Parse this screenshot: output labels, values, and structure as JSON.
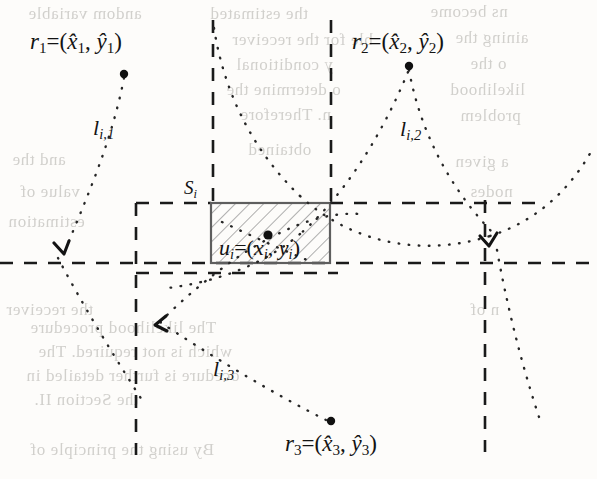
{
  "figure": {
    "background_color": "#fdfcfa",
    "ink_color": "#131313"
  },
  "labels": {
    "r1": {
      "text": "r₁=(x̂1, ŷ1)",
      "base": "r",
      "sub": "1",
      "x1": "x",
      "y1": "y",
      "pos": {
        "x": 30,
        "y": 30
      }
    },
    "r2": {
      "text": "r₂=(x̂2, ŷ2)",
      "base": "r",
      "sub": "2",
      "pos": {
        "x": 352,
        "y": 30
      }
    },
    "r3": {
      "text": "r₃=(x̂3, ŷ3)",
      "base": "r",
      "sub": "3",
      "pos": {
        "x": 285,
        "y": 432
      }
    },
    "l1": {
      "text": "lᵢ,₁",
      "base": "l",
      "sub": "i,1",
      "pos": {
        "x": 93,
        "y": 117
      }
    },
    "l2": {
      "text": "lᵢ,₂",
      "base": "l",
      "sub": "i,2",
      "pos": {
        "x": 400,
        "y": 118
      }
    },
    "l3": {
      "text": "lᵢ,₃",
      "base": "l",
      "sub": "i,3",
      "pos": {
        "x": 213,
        "y": 358
      }
    },
    "si": {
      "text": "Sᵢ",
      "base": "S",
      "sub": "i",
      "pos": {
        "x": 184,
        "y": 178
      }
    },
    "ui": {
      "text": "uᵢ=(xᵢ, yᵢ)",
      "base": "u",
      "sub": "i",
      "pos": {
        "x": 219,
        "y": 237
      }
    }
  },
  "anchors": {
    "r1_point": {
      "x": 124,
      "y": 72
    },
    "r2_point": {
      "x": 409,
      "y": 64
    },
    "r3_point": {
      "x": 331,
      "y": 423
    },
    "ui_point": {
      "x": 268,
      "y": 238
    }
  },
  "region": {
    "name": "S_i",
    "hatched_rect": {
      "x": 211,
      "y": 203,
      "width": 119,
      "height": 60
    },
    "hatch_angle_deg": 45,
    "hatch_color": "#8d8d8d",
    "border_color": "#5e5e5e"
  },
  "grid": {
    "style": "dashed",
    "color": "#1a1a1a",
    "vertical_lines_x": [
      136,
      211,
      330,
      485
    ],
    "horizontal_lines_y": [
      203,
      263,
      273
    ]
  },
  "dotted_paths": {
    "color": "#262626",
    "style": "dotted",
    "description": "Distance measurement arcs from each reference node r_k toward the region S_i"
  },
  "arrowheads": [
    {
      "name": "arrowhead-l1",
      "x": 62,
      "y": 252,
      "angle_deg": 205
    },
    {
      "name": "arrowhead-l2",
      "x": 488,
      "y": 243,
      "angle_deg": 250
    },
    {
      "name": "arrowhead-l3",
      "x": 157,
      "y": 324,
      "angle_deg": 140
    }
  ],
  "ghost_text": [
    {
      "text": "andom variable",
      "x": 28,
      "y": 4
    },
    {
      "text": "the estimated",
      "x": 210,
      "y": 4
    },
    {
      "text": "ns become",
      "x": 430,
      "y": 2
    },
    {
      "text": "ble for the receiver",
      "x": 232,
      "y": 30
    },
    {
      "text": "aining the",
      "x": 455,
      "y": 28
    },
    {
      "text": "y conditional",
      "x": 236,
      "y": 55
    },
    {
      "text": "o the",
      "x": 470,
      "y": 54
    },
    {
      "text": "o determine the",
      "x": 226,
      "y": 80
    },
    {
      "text": "likelihood",
      "x": 450,
      "y": 80
    },
    {
      "text": "n. Therefore",
      "x": 240,
      "y": 105
    },
    {
      "text": "problem",
      "x": 460,
      "y": 106
    },
    {
      "text": "and the",
      "x": 12,
      "y": 150
    },
    {
      "text": "obtained",
      "x": 248,
      "y": 140
    },
    {
      "text": "a given",
      "x": 455,
      "y": 152
    },
    {
      "text": "value of",
      "x": 20,
      "y": 182
    },
    {
      "text": "nodes",
      "x": 470,
      "y": 182
    },
    {
      "text": "estimation",
      "x": 8,
      "y": 212
    },
    {
      "text": "the receiver",
      "x": 6,
      "y": 300
    },
    {
      "text": "n of",
      "x": 470,
      "y": 300
    },
    {
      "text": "The likelihood procedure",
      "x": 30,
      "y": 318
    },
    {
      "text": "which is not required. The",
      "x": 38,
      "y": 342
    },
    {
      "text": "ocedure is further detailed in",
      "x": 26,
      "y": 366
    },
    {
      "text": "the Section II.",
      "x": 34,
      "y": 390
    },
    {
      "text": "By using the principle of",
      "x": 30,
      "y": 440
    }
  ]
}
